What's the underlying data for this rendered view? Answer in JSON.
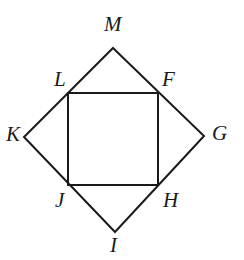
{
  "figure": {
    "type": "geometry-diagram",
    "stroke_color": "#1a1a1a",
    "background_color": "#ffffff",
    "stroke_width": 2,
    "outer_shape": {
      "name": "rhombus-KMGI",
      "vertices": [
        {
          "label": "M",
          "x": 113,
          "y": 48
        },
        {
          "label": "G",
          "x": 204,
          "y": 136
        },
        {
          "label": "I",
          "x": 115,
          "y": 232
        },
        {
          "label": "K",
          "x": 24,
          "y": 137
        }
      ]
    },
    "inner_shape": {
      "name": "rectangle-LFHJ",
      "vertices": [
        {
          "label": "L",
          "x": 68,
          "y": 93
        },
        {
          "label": "F",
          "x": 158,
          "y": 93
        },
        {
          "label": "H",
          "x": 158,
          "y": 185
        },
        {
          "label": "J",
          "x": 68,
          "y": 185
        }
      ]
    },
    "labels": [
      {
        "text": "M",
        "name": "vertex-label-m",
        "x": 104,
        "y": 14
      },
      {
        "text": "L",
        "name": "vertex-label-l",
        "x": 54,
        "y": 69
      },
      {
        "text": "F",
        "name": "vertex-label-f",
        "x": 162,
        "y": 69
      },
      {
        "text": "K",
        "name": "vertex-label-k",
        "x": 6,
        "y": 124
      },
      {
        "text": "G",
        "name": "vertex-label-g",
        "x": 212,
        "y": 123
      },
      {
        "text": "J",
        "name": "vertex-label-j",
        "x": 55,
        "y": 190
      },
      {
        "text": "H",
        "name": "vertex-label-h",
        "x": 163,
        "y": 190
      },
      {
        "text": "I",
        "name": "vertex-label-i",
        "x": 110,
        "y": 235
      }
    ]
  }
}
